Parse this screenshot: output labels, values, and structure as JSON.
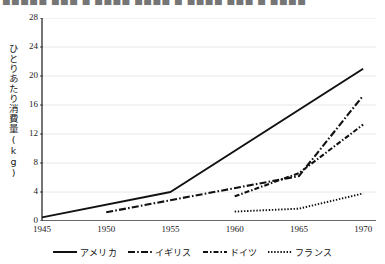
{
  "header": {
    "clipped_text": "■■■■■ ■■■ ■ ■■■■ ■■■■ ■ ■■■■ ■■■ ■ ■■■■"
  },
  "chart_data": {
    "type": "line",
    "title": "",
    "xlabel": "",
    "ylabel": "ひとりあたり消費量(kg)",
    "x": [
      1945,
      1950,
      1955,
      1960,
      1965,
      1970
    ],
    "xlim": [
      1945,
      1971
    ],
    "ylim": [
      0,
      28
    ],
    "yticks": [
      0,
      4,
      8,
      12,
      16,
      20,
      24,
      28
    ],
    "xticks": [
      1945,
      1950,
      1955,
      1960,
      1965,
      1970
    ],
    "grid": true,
    "legend_position": "bottom",
    "series": [
      {
        "name": "アメリカ",
        "style": "solid",
        "color": "#111111",
        "x": [
          1945,
          1955,
          1970
        ],
        "values": [
          0.5,
          4.0,
          21.0
        ]
      },
      {
        "name": "イギリス",
        "style": "dash-dot",
        "color": "#111111",
        "x": [
          1950,
          1965,
          1970
        ],
        "values": [
          1.2,
          6.2,
          17.3
        ]
      },
      {
        "name": "ドイツ",
        "style": "dash-dot-short",
        "color": "#111111",
        "x": [
          1960,
          1965,
          1970
        ],
        "values": [
          3.4,
          6.6,
          13.3
        ]
      },
      {
        "name": "フランス",
        "style": "dotted",
        "color": "#111111",
        "x": [
          1960,
          1965,
          1970
        ],
        "values": [
          1.3,
          1.7,
          3.8
        ]
      }
    ]
  },
  "axis": {
    "y_tick_labels": [
      "0",
      "4",
      "8",
      "12",
      "16",
      "20",
      "24",
      "28"
    ],
    "x_tick_labels": [
      "1945",
      "1950",
      "1955",
      "1960",
      "1965",
      "1970"
    ]
  },
  "legend": {
    "items": [
      {
        "label": "アメリカ",
        "style": "solid"
      },
      {
        "label": "イギリス",
        "style": "dash-dot"
      },
      {
        "label": "ドイツ",
        "style": "dash-dot-short"
      },
      {
        "label": "フランス",
        "style": "dotted"
      }
    ]
  },
  "colors": {
    "line": "#111111",
    "axis": "#3a3a3a",
    "grid": "#e8e8e8",
    "text": "#1a1a1a"
  }
}
